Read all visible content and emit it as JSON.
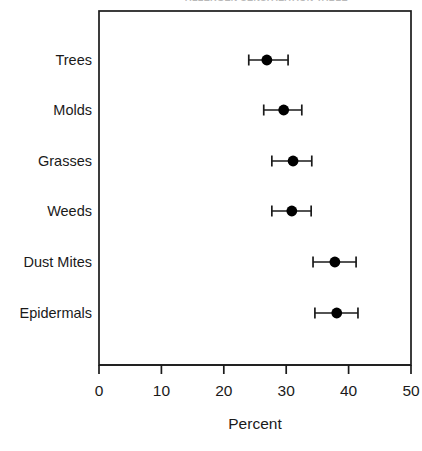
{
  "clipped_caption_sliver": "ALLERGEN SENSITIZATION TABLE",
  "chart_data": {
    "type": "scatter",
    "orientation": "horizontal",
    "title": "",
    "xlabel": "Percent",
    "ylabel": "",
    "xlim": [
      0,
      50
    ],
    "xticks": [
      0,
      10,
      20,
      30,
      40,
      50
    ],
    "xtick_labels": [
      "0",
      "10",
      "20",
      "30",
      "40",
      "50"
    ],
    "grid": false,
    "legend": false,
    "error_bars": "horizontal-with-caps",
    "marker": "filled-circle",
    "marker_color": "#000000",
    "categories": [
      "Trees",
      "Molds",
      "Grasses",
      "Weeds",
      "Dust Mites",
      "Epidermals"
    ],
    "values": [
      26.9,
      29.6,
      31.1,
      30.9,
      37.8,
      38.1
    ],
    "ci_lower": [
      24.0,
      26.4,
      27.7,
      27.7,
      34.3,
      34.6
    ],
    "ci_upper": [
      30.3,
      32.5,
      34.1,
      34.0,
      41.2,
      41.5
    ],
    "points": [
      {
        "category": "Trees",
        "value": 26.9,
        "lower": 24.0,
        "upper": 30.3
      },
      {
        "category": "Molds",
        "value": 29.6,
        "lower": 26.4,
        "upper": 32.5
      },
      {
        "category": "Grasses",
        "value": 31.1,
        "lower": 27.7,
        "upper": 34.1
      },
      {
        "category": "Weeds",
        "value": 30.9,
        "lower": 27.7,
        "upper": 34.0
      },
      {
        "category": "Dust Mites",
        "value": 37.8,
        "lower": 34.3,
        "upper": 41.2
      },
      {
        "category": "Epidermals",
        "value": 38.1,
        "lower": 34.6,
        "upper": 41.5
      }
    ]
  },
  "style": {
    "frame_color": "#1a1a1a",
    "axis_color": "#1a1a1a",
    "background": "#ffffff"
  }
}
